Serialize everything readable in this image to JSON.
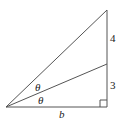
{
  "diagram": {
    "type": "right triangle with angle bisector",
    "labels": {
      "upper_segment": "4",
      "lower_segment": "3",
      "base": "b",
      "angle_upper": "θ",
      "angle_lower": "θ"
    },
    "colors": {
      "line": "#555555",
      "text": "#222222"
    }
  }
}
